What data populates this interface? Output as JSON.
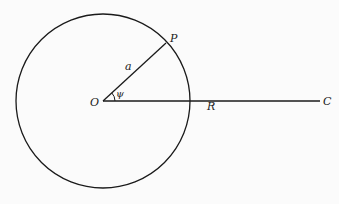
{
  "diagram": {
    "type": "geometry",
    "colors": {
      "background": "#fbfbfb",
      "stroke": "#1a1a1a"
    },
    "circle": {
      "cx": 103,
      "cy": 101,
      "r": 87
    },
    "points": {
      "O": {
        "x": 103,
        "y": 101
      },
      "P": {
        "x": 166,
        "y": 43
      },
      "C": {
        "x": 320,
        "y": 101
      }
    },
    "labels": {
      "O": "O",
      "P": "P",
      "C": "C",
      "radius": "a",
      "distance": "R",
      "angle": "ψ"
    }
  }
}
